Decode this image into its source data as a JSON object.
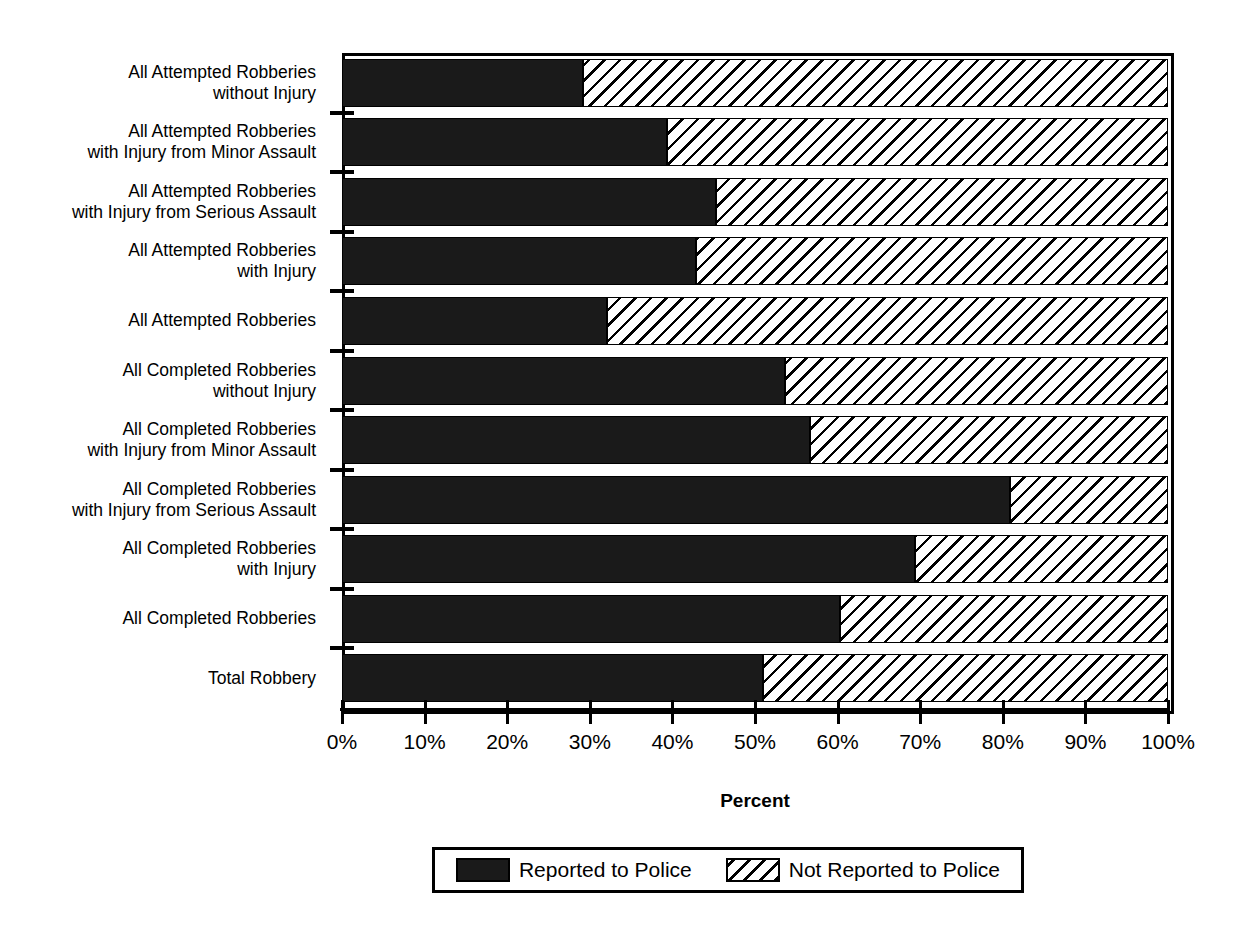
{
  "chart_data": {
    "type": "bar",
    "orientation": "horizontal",
    "stacked": true,
    "stack_mode": "percent",
    "title": "",
    "xlabel": "Percent",
    "ylabel": "",
    "xlim": [
      0,
      100
    ],
    "xticks": [
      0,
      10,
      20,
      30,
      40,
      50,
      60,
      70,
      80,
      90,
      100
    ],
    "xticklabels": [
      "0%",
      "10%",
      "20%",
      "30%",
      "40%",
      "50%",
      "60%",
      "70%",
      "80%",
      "90%",
      "100%"
    ],
    "grid": false,
    "legend_position": "bottom",
    "categories": [
      "All Attempted Robberies\nwithout Injury",
      "All Attempted Robberies\nwith Injury from Minor Assault",
      "All Attempted Robberies\nwith Injury from Serious Assault",
      "All Attempted Robberies\nwith Injury",
      "All Attempted Robberies",
      "All Completed Robberies\nwithout Injury",
      "All Completed Robberies\nwith Injury from Minor Assault",
      "All Completed Robberies\nwith Injury from Serious Assault",
      "All Completed Robberies\nwith Injury",
      "All Completed Robberies",
      "Total Robbery"
    ],
    "series": [
      {
        "name": "Reported to Police",
        "color": "#1a1a1a",
        "pattern": "solid",
        "values": [
          29.2,
          39.3,
          45.3,
          42.9,
          32.1,
          53.6,
          56.7,
          80.9,
          69.4,
          60.3,
          51.0
        ]
      },
      {
        "name": "Not Reported to Police",
        "color": "#ffffff",
        "pattern": "diagonal-hatch",
        "values": [
          70.8,
          60.7,
          54.7,
          57.1,
          67.9,
          46.4,
          43.3,
          19.1,
          30.6,
          39.7,
          49.0
        ]
      }
    ]
  },
  "axis": {
    "x_title": "Percent"
  },
  "legend": {
    "entries": [
      {
        "label": "Reported to Police",
        "swatch": "solid-black-swatch"
      },
      {
        "label": "Not Reported to Police",
        "swatch": "diagonal-hatch-swatch"
      }
    ]
  }
}
